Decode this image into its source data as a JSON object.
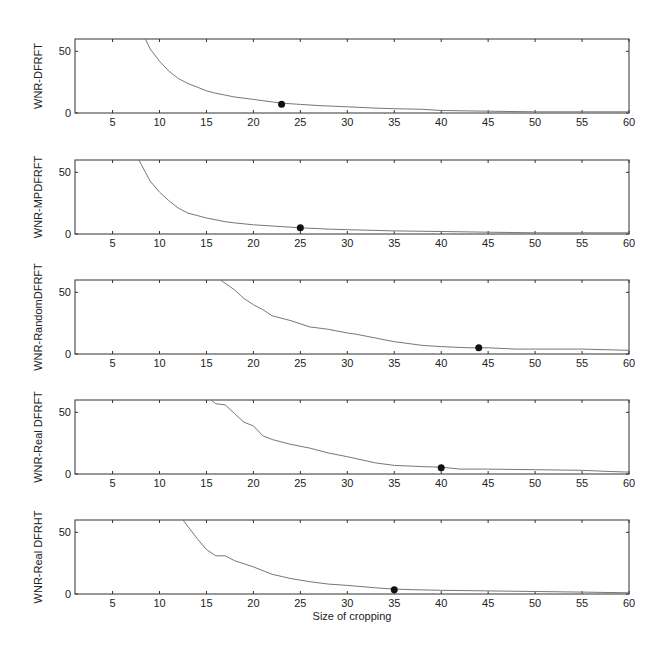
{
  "figure": {
    "xlabel": "Size of cropping"
  },
  "chart_data": [
    {
      "type": "line",
      "title": "",
      "xlabel": "",
      "ylabel": "WNR-DFRFT",
      "xlim": [
        1,
        60
      ],
      "ylim": [
        0,
        60
      ],
      "xticks": [
        5,
        10,
        15,
        20,
        25,
        30,
        35,
        40,
        45,
        50,
        55,
        60
      ],
      "yticks": [
        0,
        50
      ],
      "grid": false,
      "x": [
        8.5,
        9,
        10,
        11,
        12,
        13,
        14,
        15,
        16,
        17,
        18,
        19,
        20,
        21,
        22,
        23,
        24,
        25,
        27,
        30,
        33,
        35,
        38,
        40,
        45,
        50,
        55,
        60
      ],
      "values": [
        60,
        52,
        42,
        34,
        28,
        24,
        21,
        18,
        16,
        14.5,
        13,
        12,
        11,
        10,
        9,
        8,
        7.5,
        7,
        6,
        5,
        4,
        3.5,
        3,
        2,
        1.5,
        1,
        1,
        1
      ],
      "marker": {
        "x": 23,
        "y": 7
      }
    },
    {
      "type": "line",
      "title": "",
      "xlabel": "",
      "ylabel": "WNR-MPDFRFT",
      "xlim": [
        1,
        60
      ],
      "ylim": [
        0,
        60
      ],
      "xticks": [
        5,
        10,
        15,
        20,
        25,
        30,
        35,
        40,
        45,
        50,
        55,
        60
      ],
      "yticks": [
        0,
        50
      ],
      "grid": false,
      "x": [
        7.8,
        8.5,
        9,
        10,
        11,
        12,
        13,
        14,
        15,
        16,
        17,
        18,
        20,
        22,
        25,
        28,
        30,
        35,
        40,
        45,
        50,
        55,
        60
      ],
      "values": [
        60,
        50,
        43,
        34,
        27,
        21,
        17,
        15,
        13,
        11.5,
        10,
        9,
        7.5,
        6.5,
        5,
        4,
        3.5,
        2.5,
        2,
        1.5,
        1,
        1,
        1
      ],
      "marker": {
        "x": 25,
        "y": 5
      }
    },
    {
      "type": "line",
      "title": "",
      "xlabel": "",
      "ylabel": "WNR-RandomDFRFT",
      "xlim": [
        1,
        60
      ],
      "ylim": [
        0,
        60
      ],
      "xticks": [
        5,
        10,
        15,
        20,
        25,
        30,
        35,
        40,
        45,
        50,
        55,
        60
      ],
      "yticks": [
        0,
        50
      ],
      "grid": false,
      "x": [
        16.5,
        18,
        19,
        20,
        21,
        22,
        24,
        26,
        28,
        30,
        31,
        33,
        35,
        38,
        40,
        43,
        45,
        48,
        50,
        55,
        60
      ],
      "values": [
        60,
        52,
        45,
        40,
        36,
        31,
        27,
        22,
        20,
        17,
        16,
        13,
        10,
        7,
        6,
        5,
        5,
        4,
        4,
        4,
        3
      ],
      "marker": {
        "x": 44,
        "y": 5
      }
    },
    {
      "type": "line",
      "title": "",
      "xlabel": "",
      "ylabel": "WNR-Real DFRFT",
      "xlim": [
        1,
        60
      ],
      "ylim": [
        0,
        60
      ],
      "xticks": [
        5,
        10,
        15,
        20,
        25,
        30,
        35,
        40,
        45,
        50,
        55,
        60
      ],
      "yticks": [
        0,
        50
      ],
      "grid": false,
      "x": [
        15.5,
        16,
        17,
        18,
        19,
        20,
        21,
        22,
        24,
        26,
        28,
        30,
        33,
        35,
        38,
        40,
        42,
        45,
        50,
        55,
        58,
        60
      ],
      "values": [
        60,
        57,
        56,
        49,
        42,
        39,
        31,
        28,
        24,
        21,
        17,
        14,
        9,
        7,
        6,
        5.5,
        4,
        4,
        3.5,
        3,
        2,
        1.5
      ],
      "marker": {
        "x": 40,
        "y": 5
      }
    },
    {
      "type": "line",
      "title": "",
      "xlabel": "Size of cropping",
      "ylabel": "WNR-Real DFRHT",
      "xlim": [
        1,
        60
      ],
      "ylim": [
        0,
        60
      ],
      "xticks": [
        5,
        10,
        15,
        20,
        25,
        30,
        35,
        40,
        45,
        50,
        55,
        60
      ],
      "yticks": [
        0,
        50
      ],
      "grid": false,
      "x": [
        12.5,
        13,
        14,
        15,
        16,
        17,
        18,
        20,
        22,
        24,
        26,
        28,
        30,
        33,
        35,
        37,
        40,
        45,
        50,
        55,
        60
      ],
      "values": [
        60,
        55,
        45,
        36,
        31,
        31,
        27,
        22,
        16,
        12.5,
        10,
        8,
        7,
        5,
        4,
        3.5,
        3,
        2.5,
        2,
        1.5,
        1
      ],
      "marker": {
        "x": 35,
        "y": 3.5
      }
    }
  ]
}
